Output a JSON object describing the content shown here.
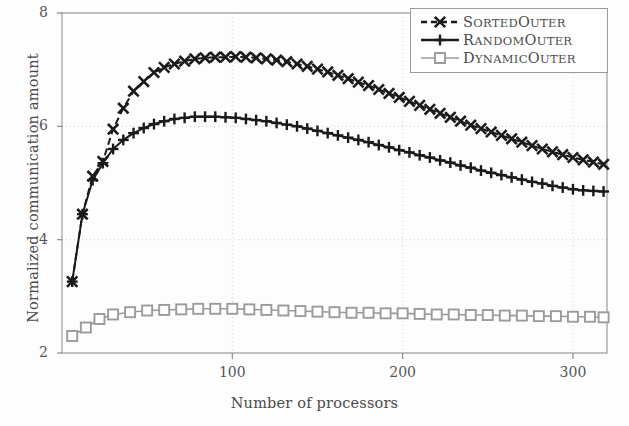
{
  "chart_data": {
    "type": "line",
    "title": "",
    "xlabel": "Number of processors",
    "ylabel": "Normalized communication amount",
    "xlim": [
      0,
      320
    ],
    "ylim": [
      2,
      8
    ],
    "xticks": [
      100,
      200,
      300
    ],
    "yticks": [
      2,
      4,
      6,
      8
    ],
    "grid": true,
    "grid_style": "dotted",
    "legend_position": "top-right",
    "series": [
      {
        "name": "SortedOuter",
        "name_parts": [
          "S",
          "ORTED",
          "O",
          "UTER"
        ],
        "marker": "x",
        "line_style": "dashed",
        "color": "#1a1a1a",
        "x": [
          6,
          12,
          18,
          24,
          30,
          36,
          42,
          48,
          54,
          60,
          66,
          72,
          78,
          84,
          90,
          96,
          102,
          108,
          114,
          120,
          126,
          132,
          138,
          144,
          150,
          156,
          162,
          168,
          174,
          180,
          186,
          192,
          198,
          204,
          210,
          216,
          222,
          228,
          234,
          240,
          246,
          252,
          258,
          264,
          270,
          276,
          282,
          288,
          294,
          300,
          306,
          312,
          318
        ],
        "y": [
          3.26,
          4.45,
          5.12,
          5.38,
          5.95,
          6.32,
          6.62,
          6.79,
          6.95,
          7.04,
          7.1,
          7.15,
          7.19,
          7.21,
          7.22,
          7.22,
          7.23,
          7.22,
          7.21,
          7.19,
          7.17,
          7.14,
          7.1,
          7.06,
          7.01,
          6.96,
          6.9,
          6.84,
          6.78,
          6.72,
          6.65,
          6.58,
          6.51,
          6.44,
          6.37,
          6.3,
          6.23,
          6.16,
          6.09,
          6.02,
          5.96,
          5.9,
          5.84,
          5.78,
          5.72,
          5.66,
          5.6,
          5.55,
          5.5,
          5.45,
          5.41,
          5.37,
          5.33
        ]
      },
      {
        "name": "RandomOuter",
        "name_parts": [
          "R",
          "ANDOM",
          "O",
          "UTER"
        ],
        "marker": "plus",
        "line_style": "solid",
        "color": "#1a1a1a",
        "x": [
          6,
          12,
          18,
          24,
          30,
          36,
          42,
          48,
          54,
          60,
          66,
          72,
          78,
          84,
          90,
          96,
          102,
          108,
          114,
          120,
          126,
          132,
          138,
          144,
          150,
          156,
          162,
          168,
          174,
          180,
          186,
          192,
          198,
          204,
          210,
          216,
          222,
          228,
          234,
          240,
          246,
          252,
          258,
          264,
          270,
          276,
          282,
          288,
          294,
          300,
          306,
          312,
          318
        ],
        "y": [
          3.26,
          4.45,
          5.05,
          5.35,
          5.6,
          5.76,
          5.88,
          5.97,
          6.04,
          6.09,
          6.13,
          6.15,
          6.17,
          6.17,
          6.17,
          6.16,
          6.15,
          6.13,
          6.11,
          6.09,
          6.06,
          6.03,
          6.0,
          5.96,
          5.92,
          5.88,
          5.84,
          5.8,
          5.76,
          5.72,
          5.67,
          5.63,
          5.58,
          5.54,
          5.49,
          5.45,
          5.4,
          5.36,
          5.31,
          5.27,
          5.22,
          5.18,
          5.14,
          5.1,
          5.06,
          5.02,
          4.99,
          4.95,
          4.92,
          4.89,
          4.87,
          4.86,
          4.85
        ]
      },
      {
        "name": "DynamicOuter",
        "name_parts": [
          "D",
          "YNAMIC",
          "O",
          "UTER"
        ],
        "marker": "square",
        "line_style": "solid",
        "color": "#9b9b9b",
        "x": [
          6,
          14,
          22,
          30,
          40,
          50,
          60,
          70,
          80,
          90,
          100,
          110,
          120,
          130,
          140,
          150,
          160,
          170,
          180,
          190,
          200,
          210,
          220,
          230,
          240,
          250,
          260,
          270,
          280,
          290,
          300,
          310,
          318
        ],
        "y": [
          2.3,
          2.45,
          2.6,
          2.68,
          2.72,
          2.75,
          2.76,
          2.77,
          2.78,
          2.78,
          2.78,
          2.77,
          2.76,
          2.75,
          2.74,
          2.73,
          2.72,
          2.71,
          2.71,
          2.7,
          2.7,
          2.69,
          2.68,
          2.68,
          2.67,
          2.67,
          2.66,
          2.66,
          2.65,
          2.65,
          2.64,
          2.64,
          2.63
        ]
      }
    ]
  },
  "axes": {
    "ylabel": "Normalized communication amount",
    "xlabel": "Number of processors",
    "ytick_labels": [
      "8",
      "6",
      "4",
      "2"
    ],
    "xtick_labels": [
      "100",
      "200",
      "300"
    ]
  },
  "legend": {
    "items": [
      {
        "label": "SortedOuter",
        "first": "S",
        "rest1": "ORTED",
        "second": "O",
        "rest2": "UTER"
      },
      {
        "label": "RandomOuter",
        "first": "R",
        "rest1": "ANDOM",
        "second": "O",
        "rest2": "UTER"
      },
      {
        "label": "DynamicOuter",
        "first": "D",
        "rest1": "YNAMIC",
        "second": "O",
        "rest2": "UTER"
      }
    ]
  },
  "colors": {
    "axis": "#8a8a8a",
    "grid": "#c9c9c9",
    "dark_series": "#1a1a1a",
    "gray_series": "#9b9b9b",
    "text": "#4a4a4a"
  }
}
